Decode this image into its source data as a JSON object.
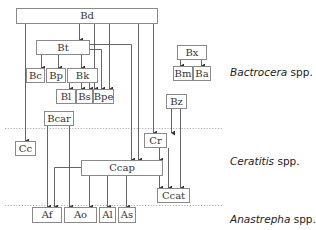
{
  "diagram": {
    "title": "",
    "nodes": [
      {
        "id": "Bd",
        "label": "Bd",
        "x": 16,
        "y": 8,
        "w": 142,
        "h": 16
      },
      {
        "id": "Bt",
        "label": "Bt",
        "x": 36,
        "y": 40,
        "w": 54,
        "h": 15
      },
      {
        "id": "Bc",
        "label": "Bc",
        "x": 26,
        "y": 68,
        "w": 19,
        "h": 15
      },
      {
        "id": "Bp",
        "label": "Bp",
        "x": 46,
        "y": 68,
        "w": 20,
        "h": 15
      },
      {
        "id": "Bk",
        "label": "Bk",
        "x": 67,
        "y": 68,
        "w": 31,
        "h": 15
      },
      {
        "id": "Bl",
        "label": "Bl",
        "x": 56,
        "y": 89,
        "w": 20,
        "h": 15
      },
      {
        "id": "Bs",
        "label": "Bs",
        "x": 76,
        "y": 89,
        "w": 17,
        "h": 15
      },
      {
        "id": "Bpe",
        "label": "Bpe",
        "x": 93,
        "y": 89,
        "w": 21,
        "h": 15
      },
      {
        "id": "Bx",
        "label": "Bx",
        "x": 177,
        "y": 45,
        "w": 30,
        "h": 15
      },
      {
        "id": "Bm",
        "label": "Bm",
        "x": 173,
        "y": 66,
        "w": 20,
        "h": 15
      },
      {
        "id": "Ba",
        "label": "Ba",
        "x": 193,
        "y": 66,
        "w": 18,
        "h": 15
      },
      {
        "id": "Bz",
        "label": "Bz",
        "x": 166,
        "y": 94,
        "w": 21,
        "h": 15
      },
      {
        "id": "Bcar",
        "label": "Bcar",
        "x": 44,
        "y": 111,
        "w": 30,
        "h": 15
      },
      {
        "id": "Cc",
        "label": "Cc",
        "x": 15,
        "y": 141,
        "w": 21,
        "h": 15
      },
      {
        "id": "Cr",
        "label": "Cr",
        "x": 144,
        "y": 133,
        "w": 23,
        "h": 15
      },
      {
        "id": "Ccap",
        "label": "Ccap",
        "x": 81,
        "y": 160,
        "w": 82,
        "h": 16
      },
      {
        "id": "Ccat",
        "label": "Ccat",
        "x": 157,
        "y": 188,
        "w": 33,
        "h": 15
      },
      {
        "id": "Af",
        "label": "Af",
        "x": 32,
        "y": 207,
        "w": 30,
        "h": 16
      },
      {
        "id": "Ao",
        "label": "Ao",
        "x": 64,
        "y": 207,
        "w": 33,
        "h": 16
      },
      {
        "id": "Al",
        "label": "Al",
        "x": 99,
        "y": 207,
        "w": 17,
        "h": 16
      },
      {
        "id": "As",
        "label": "As",
        "x": 118,
        "y": 207,
        "w": 18,
        "h": 16
      }
    ],
    "edges": [
      {
        "from": "Bd",
        "to": "Bt"
      },
      {
        "from": "Bd",
        "to": "Bk"
      },
      {
        "from": "Bd",
        "to": "Bpe"
      },
      {
        "from": "Bd",
        "to": "Cc"
      },
      {
        "from": "Bd",
        "to": "Ccap"
      },
      {
        "from": "Bd",
        "to": "Cr"
      },
      {
        "from": "Bt",
        "to": "Bc"
      },
      {
        "from": "Bt",
        "to": "Bp"
      },
      {
        "from": "Bt",
        "to": "Bk"
      },
      {
        "from": "Bt",
        "to": "Bpe"
      },
      {
        "from": "Bt",
        "to": "Ccap"
      },
      {
        "from": "Bk",
        "to": "Bl"
      },
      {
        "from": "Bk",
        "to": "Bs"
      },
      {
        "from": "Bk",
        "to": "Bpe"
      },
      {
        "from": "Bx",
        "to": "Bm"
      },
      {
        "from": "Bx",
        "to": "Ba"
      },
      {
        "from": "Bz",
        "to": "Cr"
      },
      {
        "from": "Bz",
        "to": "Ccat"
      },
      {
        "from": "Bcar",
        "to": "Af"
      },
      {
        "from": "Bcar",
        "to": "Ao"
      },
      {
        "from": "Cr",
        "to": "Ccap"
      },
      {
        "from": "Cr",
        "to": "Ccat"
      },
      {
        "from": "Ccap",
        "to": "Ccat"
      },
      {
        "from": "Ccap",
        "to": "Af"
      },
      {
        "from": "Ccap",
        "to": "Ao"
      },
      {
        "from": "Ccap",
        "to": "Al"
      },
      {
        "from": "Ccap",
        "to": "As"
      }
    ],
    "groups": [
      {
        "italic": "Bactrocera",
        "suffix": " spp.",
        "x": 230,
        "y": 66
      },
      {
        "italic": "Ceratitis",
        "suffix": " spp.",
        "x": 230,
        "y": 155
      },
      {
        "italic": "Anastrepha",
        "suffix": " spp.",
        "x": 230,
        "y": 213
      }
    ],
    "separators": [
      {
        "y": 128.5,
        "x1": 5,
        "x2": 222
      },
      {
        "y": 205.5,
        "x1": 5,
        "x2": 222
      }
    ],
    "colors": {
      "line": "#555555",
      "border": "#8a8a8a",
      "separator": "#9a9a9a"
    }
  }
}
